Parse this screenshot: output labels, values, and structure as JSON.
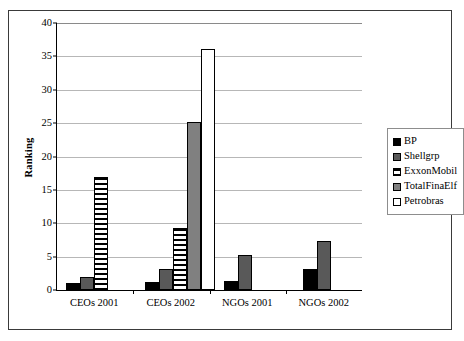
{
  "chart_data": {
    "type": "bar",
    "title": "",
    "subtitle": "",
    "xlabel": "",
    "ylabel": "Ranking",
    "ylim": [
      0,
      40
    ],
    "yticks": [
      0,
      5,
      10,
      15,
      20,
      25,
      30,
      35,
      40
    ],
    "ytick_labels": [
      "0",
      "5",
      "10",
      "15",
      "20",
      "25",
      "30",
      "35",
      "40"
    ],
    "grid": true,
    "grid_axis": "y",
    "legend_position": "right",
    "categories": [
      "CEOs 2001",
      "CEOs 2002",
      "NGOs 2001",
      "NGOs 2002"
    ],
    "series": [
      {
        "name": "BP",
        "color": "#000000",
        "fill": "solid-black",
        "values": [
          1.1,
          1.2,
          1.3,
          3.2
        ]
      },
      {
        "name": "Shellgrp",
        "color": "#595959",
        "fill": "solid-dark-gray",
        "values": [
          2.0,
          3.1,
          5.2,
          7.3
        ]
      },
      {
        "name": "ExxonMobil",
        "color": "#ffffff",
        "fill": "horizontal-stripes",
        "values": [
          17.0,
          9.3,
          0,
          0
        ]
      },
      {
        "name": "TotalFinaElf",
        "color": "#808080",
        "fill": "solid-gray",
        "values": [
          0,
          25.2,
          0,
          0
        ]
      },
      {
        "name": "Petrobras",
        "color": "#ffffff",
        "fill": "solid-white",
        "values": [
          0,
          36.1,
          0,
          0
        ]
      }
    ]
  },
  "axis": {
    "y_title": "Ranking"
  },
  "legend": {
    "items": [
      {
        "label": "BP"
      },
      {
        "label": "Shellgrp"
      },
      {
        "label": "ExxonMobil"
      },
      {
        "label": "TotalFinaElf"
      },
      {
        "label": "Petrobras"
      }
    ]
  }
}
